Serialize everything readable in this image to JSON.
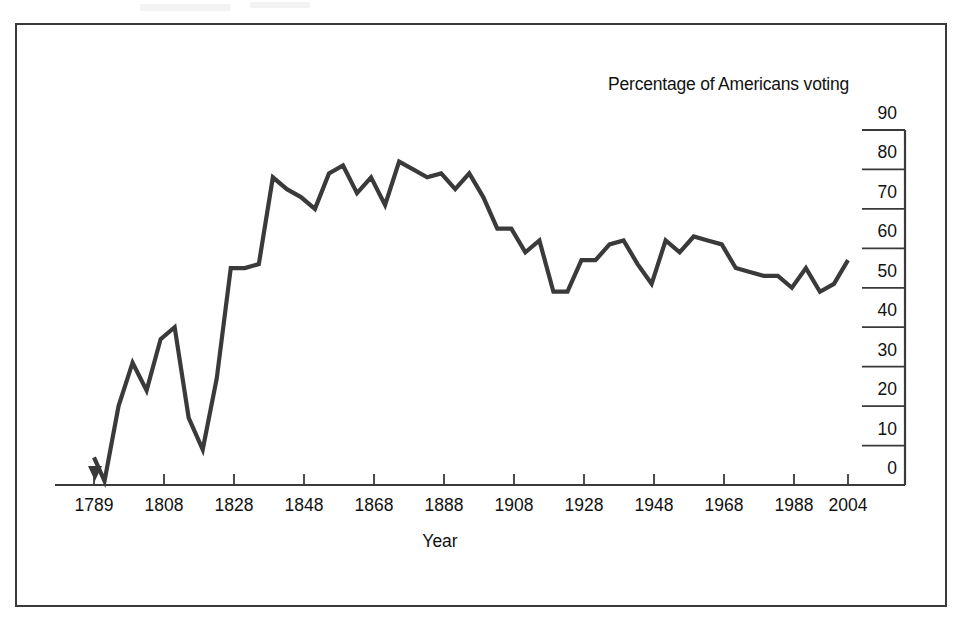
{
  "figure": {
    "title": "Percentage of Americans voting",
    "xlabel": "Year",
    "frame_color": "#3a3a3a",
    "line_color": "#3a3a3a",
    "background": "#ffffff"
  },
  "chart_data": {
    "type": "line",
    "title": "Percentage of Americans voting",
    "xlabel": "Year",
    "ylabel": "",
    "xlim": [
      1789,
      2004
    ],
    "ylim": [
      0,
      90
    ],
    "grid": false,
    "legend": null,
    "yticks": [
      0,
      10,
      20,
      30,
      40,
      50,
      60,
      70,
      80,
      90
    ],
    "ytick_labels": [
      "0",
      "10",
      "20",
      "30",
      "40",
      "50",
      "60",
      "70",
      "80",
      "90"
    ],
    "xticks": [
      1789,
      1808,
      1828,
      1848,
      1868,
      1888,
      1908,
      1928,
      1948,
      1968,
      1988,
      2004
    ],
    "xtick_labels": [
      "1789",
      "1808",
      "1828",
      "1848",
      "1868",
      "1888",
      "1908",
      "1928",
      "1948",
      "1968",
      "1988",
      "2004"
    ],
    "series": [
      {
        "name": "Percentage of Americans voting",
        "color": "#3a3a3a",
        "x": [
          1789,
          1792,
          1796,
          1800,
          1804,
          1808,
          1812,
          1816,
          1820,
          1824,
          1828,
          1832,
          1836,
          1840,
          1844,
          1848,
          1852,
          1856,
          1860,
          1864,
          1868,
          1872,
          1876,
          1880,
          1884,
          1888,
          1892,
          1896,
          1900,
          1904,
          1908,
          1912,
          1916,
          1920,
          1924,
          1928,
          1932,
          1936,
          1940,
          1944,
          1948,
          1952,
          1956,
          1960,
          1964,
          1968,
          1972,
          1976,
          1980,
          1984,
          1988,
          1992,
          1996,
          2000,
          2004
        ],
        "y": [
          7,
          1,
          20,
          31,
          24,
          37,
          40,
          17,
          9,
          27,
          55,
          55,
          56,
          78,
          75,
          73,
          70,
          79,
          81,
          74,
          78,
          71,
          82,
          80,
          78,
          79,
          75,
          79,
          73,
          65,
          65,
          59,
          62,
          49,
          49,
          57,
          57,
          61,
          62,
          56,
          51,
          62,
          59,
          63,
          62,
          61,
          55,
          54,
          53,
          53,
          50,
          55,
          49,
          51,
          57
        ]
      }
    ]
  },
  "axis": {
    "y_axis_position": "right",
    "x_axis_position": "bottom",
    "start_marker": "downward-triangle-at-1789"
  }
}
